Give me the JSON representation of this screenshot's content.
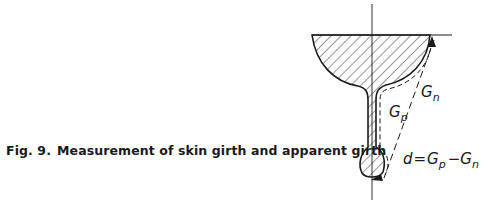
{
  "caption": {
    "figure_label": "Fig. 9.",
    "text": "Measurement of skin girth and apparent girth"
  },
  "diagram": {
    "labels": {
      "gp_main": "G",
      "gp_sub": "p",
      "gn_main": "G",
      "gn_sub": "n",
      "formula_d": "d",
      "formula_eq": "=",
      "formula_g1": "G",
      "formula_g1_sub": "p",
      "formula_minus": "−",
      "formula_g2": "G",
      "formula_g2_sub": "n"
    },
    "colors": {
      "ink": "#1a1a1a",
      "background": "#ffffff"
    }
  }
}
